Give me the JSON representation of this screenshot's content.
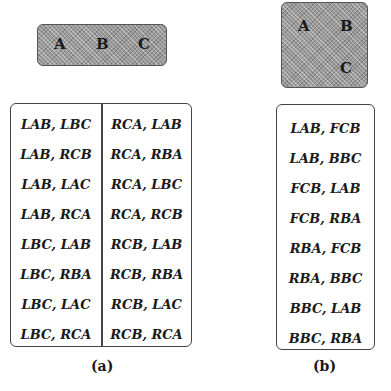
{
  "panel_a": {
    "config_nodes": [
      "A",
      "B",
      "C"
    ],
    "left_column": [
      "LAB, LBC",
      "LAB, RCB",
      "LAB, LAC",
      "LAB, RCA",
      "LBC, LAB",
      "LBC, RBA",
      "LBC, LAC",
      "LBC, RCA"
    ],
    "right_column": [
      "RCA, LAB",
      "RCA, RBA",
      "RCA, LBC",
      "RCA, RCB",
      "RCB, LAB",
      "RCB, RBA",
      "RCB, LAC",
      "RCB, RCA"
    ],
    "caption": "(a)"
  },
  "panel_b": {
    "config_nodes": [
      "A",
      "B",
      "C"
    ],
    "column": [
      "LAB, FCB",
      "LAB, BBC",
      "FCB, LAB",
      "FCB, RBA",
      "RBA, FCB",
      "RBA, BBC",
      "BBC, LAB",
      "BBC, RBA"
    ],
    "caption": "(b)"
  },
  "colors": {
    "shade": "#9a9a9a",
    "border": "#444444",
    "text": "#1a1a1a"
  }
}
